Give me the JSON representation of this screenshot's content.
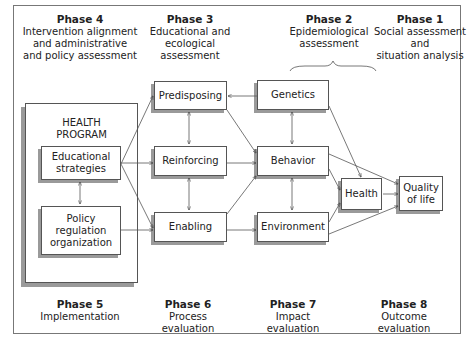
{
  "diagram": {
    "top_phases": [
      {
        "title": "Phase 4",
        "description": "Intervention alignment\nand administrative\nand policy assessment"
      },
      {
        "title": "Phase 3",
        "description": "Educational and\necological\nassessment"
      },
      {
        "title": "Phase 2",
        "description": "Epidemiological\nassessment"
      },
      {
        "title": "Phase 1",
        "description": "Social assessment\nand\nsituation analysis"
      }
    ],
    "bottom_phases": [
      {
        "title": "Phase 5",
        "description": "Implementation"
      },
      {
        "title": "Phase 6",
        "description": "Process\nevaluation"
      },
      {
        "title": "Phase 7",
        "description": "Impact\nevaluation"
      },
      {
        "title": "Phase 8",
        "description": "Outcome\nevaluation"
      }
    ],
    "health_program": {
      "title": "HEALTH\nPROGRAM",
      "components": [
        "Educational\nstrategies",
        "Policy\nregulation\norganization"
      ]
    },
    "factors": [
      "Predisposing",
      "Reinforcing",
      "Enabling"
    ],
    "determinants": [
      "Genetics",
      "Behavior",
      "Environment"
    ],
    "outcomes": {
      "health": "Health",
      "quality_of_life": "Quality\nof life"
    },
    "edges": [
      [
        "Educational strategies",
        "Predisposing"
      ],
      [
        "Educational strategies",
        "Reinforcing"
      ],
      [
        "Educational strategies",
        "Enabling"
      ],
      [
        "Policy regulation organization",
        "Enabling"
      ],
      [
        "Educational strategies",
        "Policy regulation organization",
        "bidirectional"
      ],
      [
        "Predisposing",
        "Reinforcing",
        "bidirectional"
      ],
      [
        "Reinforcing",
        "Enabling",
        "bidirectional"
      ],
      [
        "Genetics",
        "Predisposing"
      ],
      [
        "Predisposing",
        "Behavior"
      ],
      [
        "Reinforcing",
        "Behavior"
      ],
      [
        "Enabling",
        "Behavior"
      ],
      [
        "Enabling",
        "Environment"
      ],
      [
        "Genetics",
        "Behavior",
        "bidirectional"
      ],
      [
        "Behavior",
        "Environment",
        "bidirectional"
      ],
      [
        "Genetics",
        "Health"
      ],
      [
        "Behavior",
        "Health"
      ],
      [
        "Environment",
        "Health"
      ],
      [
        "Behavior",
        "Quality of life"
      ],
      [
        "Environment",
        "Quality of life"
      ],
      [
        "Health",
        "Quality of life"
      ]
    ]
  }
}
